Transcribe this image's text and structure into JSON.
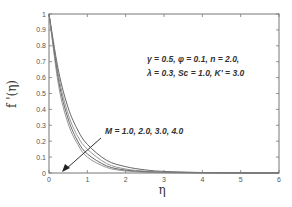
{
  "chart_data": {
    "type": "line",
    "title": "",
    "xlabel": "η",
    "ylabel": "f '(η)",
    "xlim": [
      0,
      6
    ],
    "ylim": [
      0,
      1
    ],
    "xticks": [
      "0",
      "1",
      "2",
      "3",
      "4",
      "5",
      "6"
    ],
    "yticks": [
      "0",
      "0.1",
      "0.2",
      "0.3",
      "0.4",
      "0.5",
      "0.6",
      "0.7",
      "0.8",
      "0.9",
      "1"
    ],
    "grid": false,
    "legend": null,
    "x": [
      0,
      0.25,
      0.5,
      0.75,
      1.0,
      1.5,
      2.0,
      2.5,
      3.0,
      4.0,
      5.0,
      6.0
    ],
    "series": [
      {
        "name": "M = 1.0",
        "values": [
          1.0,
          0.64,
          0.41,
          0.27,
          0.18,
          0.08,
          0.04,
          0.02,
          0.01,
          0.003,
          0.001,
          0.0
        ]
      },
      {
        "name": "M = 2.0",
        "values": [
          1.0,
          0.61,
          0.37,
          0.23,
          0.15,
          0.06,
          0.025,
          0.012,
          0.006,
          0.002,
          0.0,
          0.0
        ]
      },
      {
        "name": "M = 3.0",
        "values": [
          1.0,
          0.58,
          0.34,
          0.2,
          0.12,
          0.045,
          0.018,
          0.008,
          0.004,
          0.001,
          0.0,
          0.0
        ]
      },
      {
        "name": "M = 4.0",
        "values": [
          1.0,
          0.55,
          0.31,
          0.18,
          0.1,
          0.035,
          0.013,
          0.005,
          0.002,
          0.0,
          0.0,
          0.0
        ]
      }
    ],
    "annotations": [
      {
        "text": "γ = 0.5,  φ = 0.1,  n = 2.0,",
        "x": 2.55,
        "y": 0.77
      },
      {
        "text": "λ = 0.3,  Sc = 1.0,  K' = 3.0",
        "x": 2.55,
        "y": 0.68
      },
      {
        "text": "M = 1.0, 2.0, 3.0, 4.0",
        "x": 1.45,
        "y": 0.25,
        "arrow_from": [
          1.45,
          0.23
        ],
        "arrow_to": [
          0.45,
          0.04
        ]
      }
    ]
  },
  "labels": {
    "xlabel": "η",
    "ylabel": "f '(η)",
    "params_line1": "γ = 0.5,  φ = 0.1,  n = 2.0,",
    "params_line2": "λ = 0.3,  Sc = 1.0,  K' = 3.0",
    "arrow_label": "M = 1.0, 2.0, 3.0, 4.0"
  },
  "colors": {
    "axis": "#666666",
    "curves": "#555555",
    "text": "#333333"
  }
}
